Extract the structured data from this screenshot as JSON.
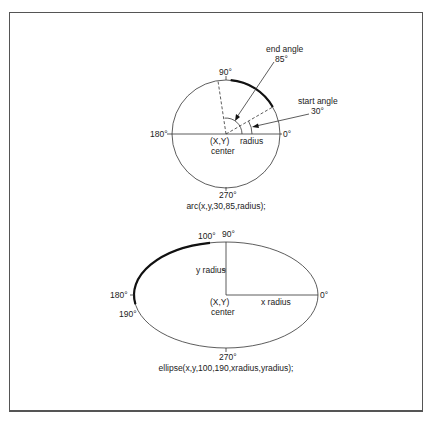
{
  "figure": {
    "arc_diagram": {
      "labels": {
        "deg90": "90°",
        "deg180": "180°",
        "deg0": "0°",
        "deg270": "270°",
        "end_angle_title": "end angle",
        "end_angle_value": "85°",
        "start_angle_title": "start angle",
        "start_angle_value": "30°",
        "center_xy": "(X,Y)",
        "center_word": "center",
        "radius": "radius"
      },
      "caption": "arc(x,y,30,85,radius);",
      "start_angle": 30,
      "end_angle": 85
    },
    "ellipse_diagram": {
      "labels": {
        "deg100": "100°",
        "deg90": "90°",
        "deg180": "180°",
        "deg190": "190°",
        "deg0": "0°",
        "deg270": "270°",
        "y_radius": "y radius",
        "x_radius": "x radius",
        "center_xy": "(X,Y)",
        "center_word": "center"
      },
      "caption": "ellipse(x,y,100,190,xradius,yradius);",
      "start_angle": 100,
      "end_angle": 190
    }
  },
  "colors": {
    "line": "#333333",
    "frame": "#555555",
    "text": "#222222"
  }
}
